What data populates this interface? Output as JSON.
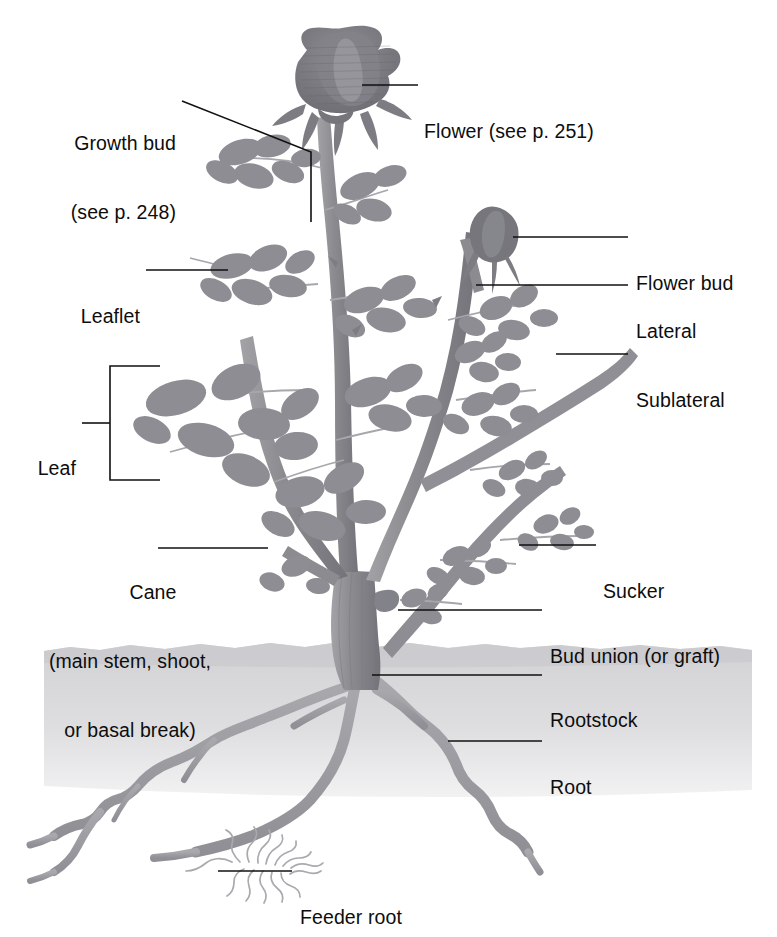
{
  "diagram": {
    "colors": {
      "plant": "#8e8e92",
      "plant_dark": "#6f6f74",
      "flower": "#77777c",
      "soil": "#d9d9db",
      "leader_line": "#111111",
      "text": "#0d0d0d",
      "background": "#ffffff"
    },
    "labels": [
      {
        "id": "growth-bud",
        "line1": "Growth bud",
        "line2": "(see p. 248)",
        "side": "left",
        "x": 62,
        "y": 86,
        "align": "left"
      },
      {
        "id": "flower",
        "line1": "Flower (see p. 251)",
        "line2": "",
        "side": "right",
        "x": 424,
        "y": 74,
        "align": "left"
      },
      {
        "id": "flower-bud",
        "line1": "Flower bud",
        "line2": "",
        "side": "right",
        "x": 634,
        "y": 226,
        "align": "left"
      },
      {
        "id": "leaflet",
        "line1": "Leaflet",
        "line2": "",
        "side": "left",
        "x": 72,
        "y": 259,
        "align": "left"
      },
      {
        "id": "lateral",
        "line1": "Lateral",
        "line2": "",
        "side": "right",
        "x": 634,
        "y": 274,
        "align": "left"
      },
      {
        "id": "sublateral",
        "line1": "Sublateral",
        "line2": "",
        "side": "right",
        "x": 634,
        "y": 343,
        "align": "left"
      },
      {
        "id": "leaf",
        "line1": "Leaf",
        "line2": "",
        "side": "left",
        "x": 37,
        "y": 411,
        "align": "left"
      },
      {
        "id": "cane",
        "line1": "Cane",
        "line2": "(main stem, shoot,",
        "line3": "or basal break)",
        "side": "left",
        "x": 12,
        "y": 535,
        "align": "center"
      },
      {
        "id": "sucker",
        "line1": "Sucker",
        "line2": "",
        "side": "right",
        "x": 603,
        "y": 534,
        "align": "left"
      },
      {
        "id": "bud-union",
        "line1": "Bud union (or graft)",
        "line2": "",
        "side": "right",
        "x": 548,
        "y": 599,
        "align": "left"
      },
      {
        "id": "rootstock",
        "line1": "Rootstock",
        "line2": "",
        "side": "right",
        "x": 548,
        "y": 663,
        "align": "left"
      },
      {
        "id": "root",
        "line1": "Root",
        "line2": "",
        "side": "right",
        "x": 548,
        "y": 730,
        "align": "left"
      },
      {
        "id": "feeder-root",
        "line1": "Feeder root",
        "line2": "",
        "side": "right",
        "x": 300,
        "y": 860,
        "align": "left"
      }
    ],
    "parts": [
      "flower",
      "flower bud",
      "growth bud",
      "leaflet",
      "leaf",
      "lateral",
      "sublateral",
      "cane",
      "sucker",
      "bud union",
      "rootstock",
      "root",
      "feeder root"
    ]
  }
}
